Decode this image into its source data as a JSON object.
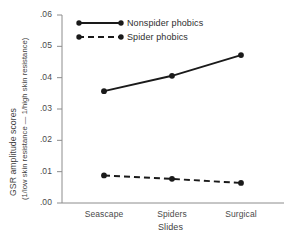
{
  "chart_data": {
    "type": "line",
    "title": "",
    "xlabel": "Slides",
    "ylabel_line1": "GSR amplitude scores",
    "ylabel_line2": "(1/low skin resistance — 1/high skin resistance)",
    "categories": [
      "Seascape",
      "Spiders",
      "Surgical"
    ],
    "ylim": [
      0.0,
      0.06
    ],
    "ytick_labels": [
      ".06",
      ".05",
      ".04",
      ".03",
      ".02",
      ".01",
      ".00"
    ],
    "ytick_values": [
      0.06,
      0.05,
      0.04,
      0.03,
      0.02,
      0.01,
      0.0
    ],
    "grid": false,
    "legend_position": "upper-left-inside",
    "series": [
      {
        "name": "Nonspider phobics",
        "values": [
          0.0357,
          0.0406,
          0.0472
        ],
        "style": "solid",
        "marker": "circle",
        "color": "#1a1a1a"
      },
      {
        "name": "Spider phobics",
        "values": [
          0.0088,
          0.0077,
          0.0064
        ],
        "style": "dashed",
        "marker": "circle",
        "color": "#1a1a1a"
      }
    ]
  },
  "axis": {
    "line_color": "#8c8c8c"
  },
  "legend": {
    "items": [
      {
        "label": "Nonspider phobics"
      },
      {
        "label": "Spider phobics"
      }
    ]
  }
}
